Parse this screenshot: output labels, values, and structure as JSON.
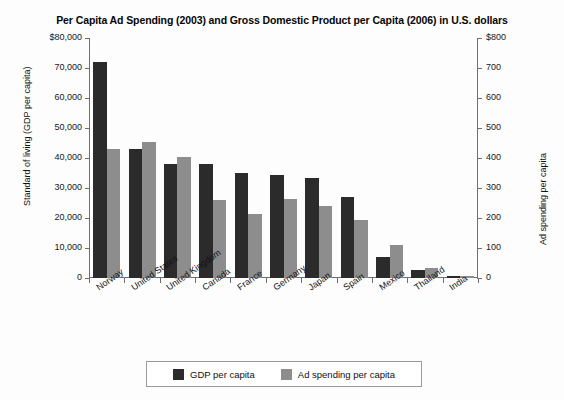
{
  "chart_data": {
    "type": "bar",
    "title": "Per Capita Ad Spending (2003) and Gross Domestic Product per Capita (2006) in U.S. dollars",
    "xlabel": "",
    "categories": [
      "Norway",
      "United States",
      "United Kingdom",
      "Canada",
      "France",
      "Germany",
      "Japan",
      "Spain",
      "Mexico",
      "Thailand",
      "India"
    ],
    "series": [
      {
        "name": "GDP per capita",
        "axis": "left",
        "color": "#2b2b2b",
        "values": [
          72000,
          43000,
          38000,
          38000,
          35000,
          34500,
          33500,
          27000,
          7000,
          2800,
          800
        ]
      },
      {
        "name": "Ad spending per capita",
        "axis": "right",
        "color": "#8d8d8d",
        "values": [
          430,
          455,
          405,
          260,
          212,
          265,
          240,
          195,
          110,
          32,
          6
        ]
      }
    ],
    "left_axis": {
      "label": "Standard of living (GDP per capita)",
      "ylim": [
        0,
        80000
      ],
      "ticks": [
        "$80,000",
        "70,000",
        "60,000",
        "50,000",
        "40,000",
        "30,000",
        "20,000",
        "10,000",
        "0"
      ],
      "tick_values": [
        80000,
        70000,
        60000,
        50000,
        40000,
        30000,
        20000,
        10000,
        0
      ]
    },
    "right_axis": {
      "label": "Ad spending per capita",
      "ylim": [
        0,
        800
      ],
      "ticks": [
        "$800",
        "700",
        "600",
        "500",
        "400",
        "300",
        "200",
        "100",
        "0"
      ],
      "tick_values": [
        800,
        700,
        600,
        500,
        400,
        300,
        200,
        100,
        0
      ]
    },
    "grid": false,
    "legend_position": "bottom"
  },
  "legend": {
    "items": [
      {
        "label": "GDP per capita",
        "color": "#2b2b2b"
      },
      {
        "label": "Ad spending per capita",
        "color": "#8d8d8d"
      }
    ]
  }
}
